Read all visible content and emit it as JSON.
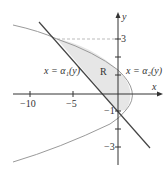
{
  "diagram": {
    "axes": {
      "x_label": "x",
      "y_label": "y"
    },
    "x_ticks": [
      {
        "value": -10,
        "label": "−10"
      },
      {
        "value": -5,
        "label": "−5"
      }
    ],
    "y_ticks": [
      {
        "value": 3,
        "label": "3"
      },
      {
        "value": -1,
        "label": "−1"
      },
      {
        "value": -3,
        "label": "−3"
      }
    ],
    "curves": {
      "left": {
        "label": "x = α₁(y)"
      },
      "right": {
        "label": "x = α₂(y)"
      }
    },
    "region_label": "R",
    "colors": {
      "region_fill": "#e6e6e6",
      "parabola": "#9a9a9a",
      "line": "#444444",
      "axis": "#333333",
      "dashed": "#aaaaaa"
    }
  }
}
